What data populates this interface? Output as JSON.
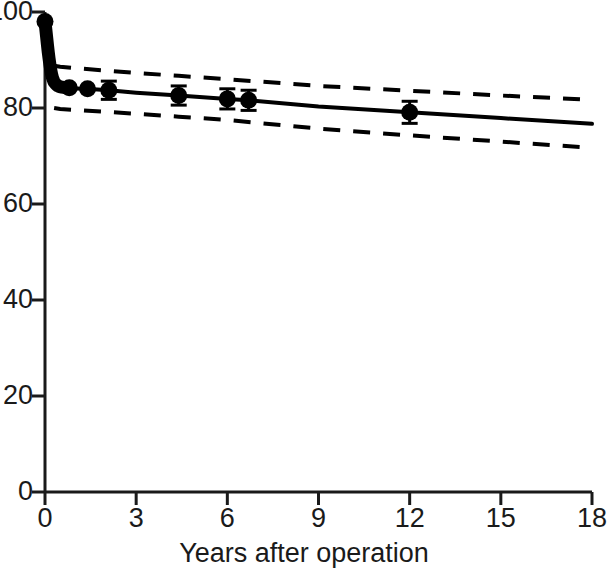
{
  "chart_data": {
    "type": "line",
    "title": "",
    "subtitle": "",
    "xlabel": "Years after operation",
    "ylabel": "",
    "xlim": [
      0,
      18
    ],
    "ylim": [
      0,
      100
    ],
    "grid": false,
    "legend": "none",
    "xticks": [
      0,
      3,
      6,
      9,
      12,
      15,
      18
    ],
    "xtick_labels": [
      "0",
      "3",
      "6",
      "9",
      "12",
      "15",
      "18"
    ],
    "yticks": [
      0,
      20,
      40,
      60,
      80,
      100
    ],
    "ytick_labels": [
      "0",
      "20",
      "40",
      "60",
      "80",
      "100"
    ],
    "ytick_clipped_note": "100",
    "series": [
      {
        "name": "survival-estimate",
        "style": "solid",
        "x": [
          0,
          0.05,
          0.1,
          0.15,
          0.2,
          0.25,
          0.3,
          0.4,
          0.5,
          0.7,
          0.9,
          1.2,
          1.6,
          2.1,
          3.0,
          4.4,
          6.0,
          6.7,
          9.0,
          12.0,
          15.0,
          18.0
        ],
        "values": [
          98.0,
          95.0,
          92.0,
          89.5,
          87.5,
          86.2,
          85.4,
          84.7,
          84.4,
          84.2,
          84.1,
          84.0,
          83.9,
          83.7,
          83.2,
          82.6,
          81.9,
          81.6,
          80.3,
          79.1,
          77.9,
          76.7
        ]
      },
      {
        "name": "upper-confidence-band",
        "style": "dashed",
        "x": [
          0.3,
          0.5,
          1.0,
          2.0,
          3.0,
          4.4,
          6.0,
          9.0,
          12.0,
          15.0,
          18.0
        ],
        "values": [
          88.8,
          88.6,
          88.3,
          87.8,
          87.3,
          86.7,
          86.0,
          84.6,
          83.6,
          82.6,
          81.7
        ]
      },
      {
        "name": "lower-confidence-band",
        "style": "dashed",
        "x": [
          0.3,
          0.5,
          1.0,
          2.0,
          3.0,
          4.4,
          6.0,
          9.0,
          12.0,
          15.0,
          18.0
        ],
        "values": [
          80.0,
          79.8,
          79.6,
          79.2,
          78.8,
          78.2,
          77.5,
          75.7,
          74.3,
          73.0,
          71.7
        ]
      }
    ],
    "points": [
      {
        "x": 0.0,
        "y": 98.0,
        "err": 0.0
      },
      {
        "x": 0.8,
        "y": 84.2,
        "err": 0.0
      },
      {
        "x": 1.4,
        "y": 84.0,
        "err": 0.0
      },
      {
        "x": 2.1,
        "y": 83.7,
        "err": 1.9
      },
      {
        "x": 4.4,
        "y": 82.6,
        "err": 2.0
      },
      {
        "x": 6.0,
        "y": 81.9,
        "err": 2.1
      },
      {
        "x": 6.7,
        "y": 81.6,
        "err": 2.1
      },
      {
        "x": 12.0,
        "y": 79.1,
        "err": 2.3
      }
    ],
    "dense_censor_band": {
      "description": "dense overlapping markers along early steep drop",
      "x_range": [
        0.0,
        0.7
      ],
      "y_range": [
        84.2,
        97.0
      ]
    },
    "colors": {
      "line": "#000000",
      "band": "#000000",
      "marker": "#000000",
      "axis": "#1a1a1a",
      "background": "#ffffff"
    }
  },
  "axis": {
    "x_title": "Years after operation"
  }
}
